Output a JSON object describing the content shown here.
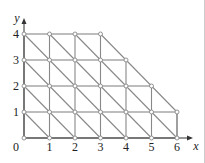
{
  "diagram": {
    "axis_labels": {
      "x": "x",
      "y": "y",
      "origin": "0"
    },
    "x_ticks": [
      "1",
      "2",
      "3",
      "4",
      "5",
      "6"
    ],
    "y_ticks": [
      "1",
      "2",
      "3",
      "4"
    ],
    "row_max_x": {
      "0": 6,
      "1": 6,
      "2": 5,
      "3": 4,
      "4": 3
    },
    "colors": {
      "line": "#888888",
      "node": "#ffffff",
      "text": "#222222"
    }
  }
}
